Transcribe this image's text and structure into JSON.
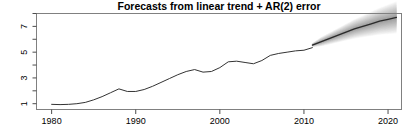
{
  "chart_data": {
    "type": "line",
    "title": "Forecasts from linear trend + AR(2) error",
    "xlabel": "",
    "ylabel": "",
    "xlim": [
      1978.2,
      2021.6
    ],
    "ylim": [
      0.55,
      8.0
    ],
    "grid": false,
    "legend": null,
    "xticks": [
      1980,
      1990,
      2000,
      2010,
      2020
    ],
    "xtick_labels": [
      "1980",
      "1990",
      "2000",
      "2010",
      "2020"
    ],
    "yticks": [
      1,
      2,
      3,
      4,
      5,
      6,
      7,
      8
    ],
    "ytick_labels": [
      "1",
      "",
      "3",
      "",
      "5",
      "",
      "7",
      ""
    ],
    "ytick_labels_rotated": true,
    "series": [
      {
        "name": "historical",
        "style": "solid-dark-line",
        "x": [
          1980,
          1981,
          1982,
          1983,
          1984,
          1985,
          1986,
          1987,
          1988,
          1989,
          1990,
          1991,
          1992,
          1993,
          1994,
          1995,
          1996,
          1997,
          1998,
          1999,
          2000,
          2001,
          2002,
          2003,
          2004,
          2005,
          2006,
          2007,
          2008,
          2009,
          2010,
          2011
        ],
        "values": [
          0.95,
          0.93,
          0.95,
          1.0,
          1.1,
          1.3,
          1.55,
          1.85,
          2.15,
          1.95,
          1.95,
          2.1,
          2.35,
          2.65,
          2.95,
          3.25,
          3.5,
          3.65,
          3.45,
          3.5,
          3.8,
          4.25,
          4.3,
          4.2,
          4.1,
          4.35,
          4.75,
          4.9,
          5.0,
          5.1,
          5.15,
          5.35
        ]
      },
      {
        "name": "point-forecast",
        "style": "solid-dark-line",
        "x": [
          2011,
          2012,
          2013,
          2014,
          2015,
          2016,
          2017,
          2018,
          2019,
          2020,
          2021
        ],
        "values": [
          5.55,
          5.8,
          6.05,
          6.3,
          6.55,
          6.8,
          7.0,
          7.2,
          7.4,
          7.55,
          7.7
        ]
      }
    ],
    "prediction_intervals": [
      {
        "name": "80% interval",
        "shade": "#8c8c8c",
        "x": [
          2011,
          2012,
          2013,
          2014,
          2015,
          2016,
          2017,
          2018,
          2019,
          2020,
          2021
        ],
        "lower": [
          5.45,
          5.6,
          5.8,
          6.0,
          6.2,
          6.4,
          6.55,
          6.7,
          6.85,
          6.95,
          7.05
        ],
        "upper": [
          5.65,
          6.0,
          6.3,
          6.6,
          6.9,
          7.2,
          7.45,
          7.7,
          7.95,
          8.15,
          8.35
        ]
      },
      {
        "name": "95% interval",
        "shade": "#c4c4c4",
        "x": [
          2011,
          2012,
          2013,
          2014,
          2015,
          2016,
          2017,
          2018,
          2019,
          2020,
          2021
        ],
        "lower": [
          5.4,
          5.45,
          5.6,
          5.75,
          5.9,
          6.05,
          6.15,
          6.25,
          6.35,
          6.4,
          6.45
        ],
        "upper": [
          5.7,
          6.15,
          6.5,
          6.85,
          7.2,
          7.55,
          7.85,
          8.15,
          8.45,
          8.7,
          8.95
        ]
      }
    ],
    "forecast_start": 2011,
    "colors": {
      "line": "#333333",
      "forecast_line": "#2b2b2b",
      "interval_80": "#8c8c8c",
      "interval_95": "#c4c4c4",
      "axis": "#4d4d4d",
      "box": "#808080",
      "background": "#ffffff"
    }
  }
}
